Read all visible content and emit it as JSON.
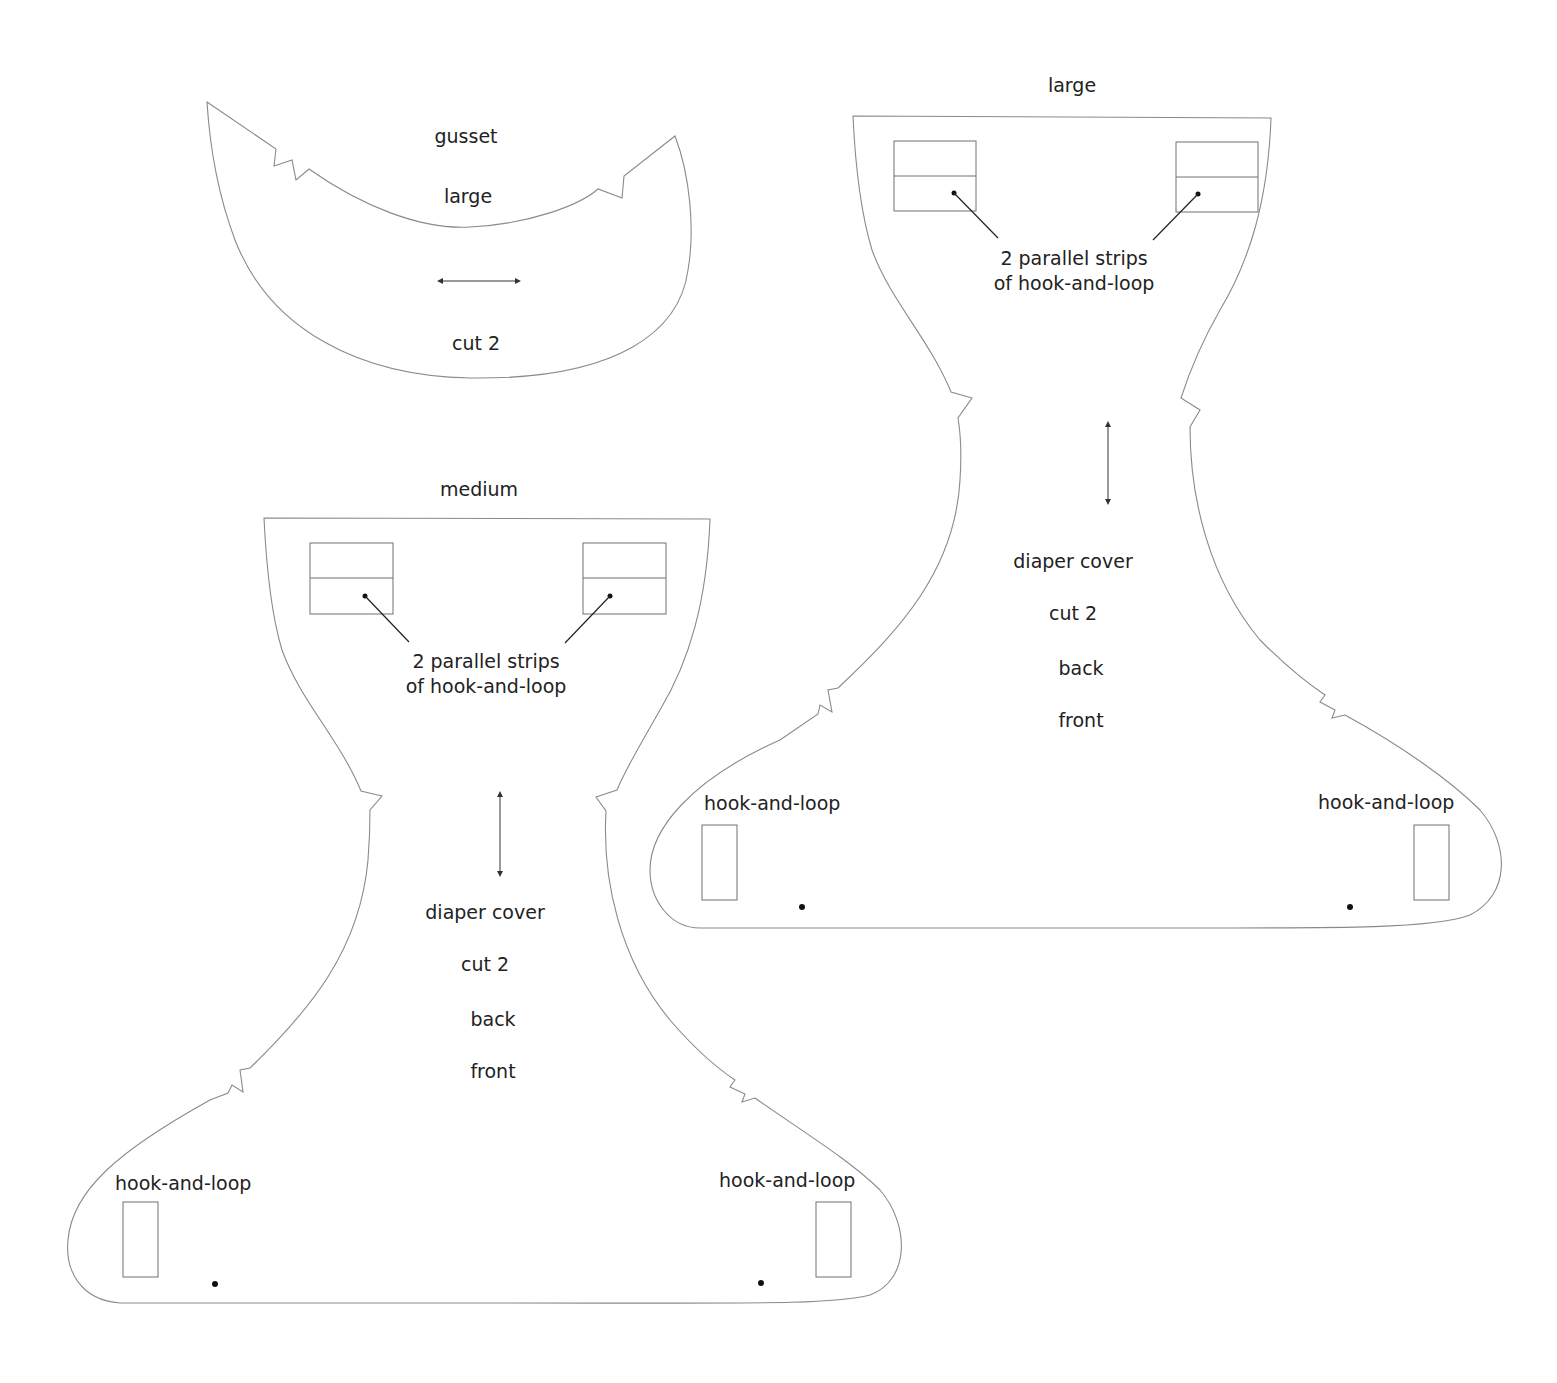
{
  "gusset": {
    "title": "gusset",
    "size": "large",
    "cut": "cut 2"
  },
  "large_cover": {
    "size": "large",
    "strips_line1": "2 parallel strips",
    "strips_line2": "of hook-and-loop",
    "name": "diaper cover",
    "cut": "cut 2",
    "back": "back",
    "front": "front",
    "left_tab": "hook-and-loop",
    "right_tab": "hook-and-loop"
  },
  "medium_cover": {
    "size": "medium",
    "strips_line1": "2 parallel strips",
    "strips_line2": "of hook-and-loop",
    "name": "diaper cover",
    "cut": "cut 2",
    "back": "back",
    "front": "front",
    "left_tab": "hook-and-loop",
    "right_tab": "hook-and-loop"
  },
  "colors": {
    "outline": "#8a8a8a",
    "text": "#222222",
    "background": "#ffffff"
  }
}
